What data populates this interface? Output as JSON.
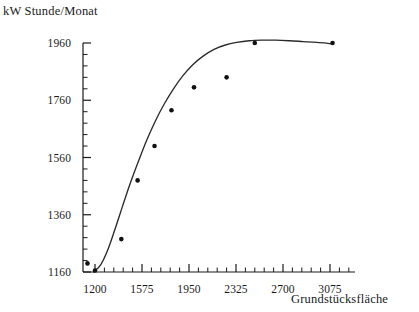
{
  "chart_data": {
    "type": "scatter",
    "title": "",
    "ylabel": "kW Stunde/Monat",
    "xlabel": "Grundstücksfläche",
    "xlim": [
      1200,
      3075
    ],
    "ylim": [
      1160,
      1960
    ],
    "grid": false,
    "legend": "none",
    "xticks": [
      1200,
      1575,
      1950,
      2325,
      2700,
      3075
    ],
    "yticks": [
      1160,
      1360,
      1560,
      1760,
      1960
    ],
    "xtick_labels": [
      "1200",
      "1575",
      "1950",
      "2325",
      "2700",
      "3075"
    ],
    "ytick_labels": [
      "1160",
      "1360",
      "1560",
      "1760",
      "1960"
    ],
    "x_minor_tick_count": 5,
    "y_minor_tick_count": 5,
    "points": [
      {
        "x": 1140,
        "y": 1190
      },
      {
        "x": 1200,
        "y": 1165
      },
      {
        "x": 1410,
        "y": 1275
      },
      {
        "x": 1540,
        "y": 1480
      },
      {
        "x": 1675,
        "y": 1600
      },
      {
        "x": 1810,
        "y": 1725
      },
      {
        "x": 1990,
        "y": 1805
      },
      {
        "x": 2250,
        "y": 1840
      },
      {
        "x": 2475,
        "y": 1960
      },
      {
        "x": 3095,
        "y": 1960
      }
    ],
    "fitted_curve": [
      {
        "x": 1190,
        "y": 1160
      },
      {
        "x": 1245,
        "y": 1185
      },
      {
        "x": 1300,
        "y": 1235
      },
      {
        "x": 1360,
        "y": 1310
      },
      {
        "x": 1420,
        "y": 1390
      },
      {
        "x": 1480,
        "y": 1468
      },
      {
        "x": 1545,
        "y": 1545
      },
      {
        "x": 1610,
        "y": 1618
      },
      {
        "x": 1680,
        "y": 1686
      },
      {
        "x": 1750,
        "y": 1745
      },
      {
        "x": 1825,
        "y": 1799
      },
      {
        "x": 1900,
        "y": 1845
      },
      {
        "x": 1980,
        "y": 1884
      },
      {
        "x": 2065,
        "y": 1915
      },
      {
        "x": 2150,
        "y": 1938
      },
      {
        "x": 2240,
        "y": 1953
      },
      {
        "x": 2330,
        "y": 1962
      },
      {
        "x": 2430,
        "y": 1968
      },
      {
        "x": 2530,
        "y": 1970
      },
      {
        "x": 2640,
        "y": 1970
      },
      {
        "x": 2750,
        "y": 1968
      },
      {
        "x": 2860,
        "y": 1965
      },
      {
        "x": 2970,
        "y": 1962
      },
      {
        "x": 3080,
        "y": 1958
      }
    ],
    "marker": {
      "shape": "circle",
      "color": "#111111",
      "size": 4.6
    },
    "line": {
      "color": "#2a2a2a",
      "width": 1.35
    },
    "axis_color": "#1a1a1a"
  }
}
